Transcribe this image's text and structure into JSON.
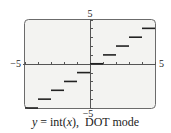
{
  "chart_data": {
    "type": "line",
    "title": "",
    "caption": {
      "y_var": "y",
      "equals": " = int(",
      "x_var": "x",
      "close": "),",
      "mode": "DOT mode"
    },
    "xlabel": "",
    "ylabel": "",
    "xlim": [
      -5,
      5
    ],
    "ylim": [
      -5,
      5
    ],
    "x_tick_labels": {
      "min": "−5",
      "max": "5"
    },
    "y_tick_labels": {
      "min": "−5",
      "max": "5"
    },
    "x_tick_step": 1,
    "y_tick_step": 1,
    "grid": false,
    "legend": null,
    "style": "step segments (DOT mode, no vertical connectors)",
    "series": [
      {
        "name": "y = int(x)",
        "segments": [
          {
            "x_start": -5,
            "x_end": -4,
            "y": -5
          },
          {
            "x_start": -4,
            "x_end": -3,
            "y": -4
          },
          {
            "x_start": -3,
            "x_end": -2,
            "y": -3
          },
          {
            "x_start": -2,
            "x_end": -1,
            "y": -2
          },
          {
            "x_start": -1,
            "x_end": 0,
            "y": -1
          },
          {
            "x_start": 0,
            "x_end": 1,
            "y": 0
          },
          {
            "x_start": 1,
            "x_end": 2,
            "y": 1
          },
          {
            "x_start": 2,
            "x_end": 3,
            "y": 2
          },
          {
            "x_start": 3,
            "x_end": 4,
            "y": 3
          },
          {
            "x_start": 4,
            "x_end": 5,
            "y": 4
          }
        ]
      }
    ]
  },
  "colors": {
    "screen_bg": "#f3f3f1",
    "frame": "#6b6b6b",
    "axis": "#555555",
    "step": "#222222",
    "text": "#222222"
  }
}
